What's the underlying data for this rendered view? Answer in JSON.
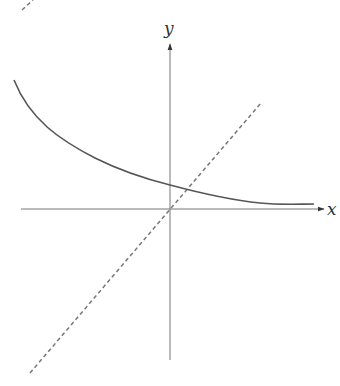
{
  "diagram": {
    "type": "function-graph",
    "axes": {
      "x_label": "x",
      "y_label": "y"
    },
    "elements": [
      {
        "name": "decreasing-curve",
        "style": "solid",
        "note": "approaches x-axis asymptotically as x increases; crosses y-axis above origin"
      },
      {
        "name": "identity-line",
        "style": "dashed",
        "note": "line y = x through the origin, intersects the curve once in the first quadrant"
      },
      {
        "name": "stray-dashed-fragment",
        "style": "dashed",
        "note": "partial dashed segment at top-left edge (cropped)"
      }
    ],
    "colors": {
      "axis": "#666666",
      "curve": "#555555",
      "dashed": "#777777",
      "background": "#ffffff"
    }
  }
}
